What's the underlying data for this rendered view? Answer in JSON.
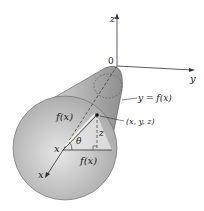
{
  "diagram": {
    "axes": {
      "z": "z",
      "y": "y",
      "x": "x",
      "origin": "0"
    },
    "labels": {
      "curve": "y = f(x)",
      "point": "(x, y, z)",
      "radius_slant": "f(x)",
      "radius_horizontal": "f(x)",
      "angle": "θ",
      "height": "z",
      "x_position": "x"
    },
    "colors": {
      "solid_fill": "#c8c8c8",
      "solid_shade": "#9a9a9a",
      "stroke": "#333333",
      "background": "#ffffff"
    }
  }
}
